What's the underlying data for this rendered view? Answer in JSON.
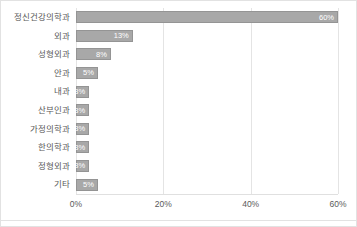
{
  "chart_data": {
    "type": "bar",
    "orientation": "horizontal",
    "title": "",
    "xlabel": "",
    "ylabel": "",
    "categories": [
      "정신건강의학과",
      "외과",
      "성형외과",
      "안과",
      "내과",
      "산부인과",
      "가정의학과",
      "한의학과",
      "정형외과",
      "기타"
    ],
    "values": [
      60,
      13,
      8,
      5,
      3,
      3,
      3,
      3,
      3,
      5
    ],
    "value_labels": [
      "60%",
      "13%",
      "8%",
      "5%",
      "3%",
      "3%",
      "3%",
      "3%",
      "3%",
      "5%"
    ],
    "xlim": [
      0,
      60
    ],
    "xticks": [
      0,
      20,
      40,
      60
    ],
    "xtick_labels": [
      "0%",
      "20%",
      "40%",
      "60%"
    ],
    "grid": true,
    "legend": "none",
    "bar_color": "#a8a8a8",
    "bar_border_color": "#949494",
    "value_label_color": "#ffffff",
    "gridline_color": "#e4e4e4",
    "axis_text_color": "#5a5a5a",
    "background_color": "#ffffff"
  }
}
